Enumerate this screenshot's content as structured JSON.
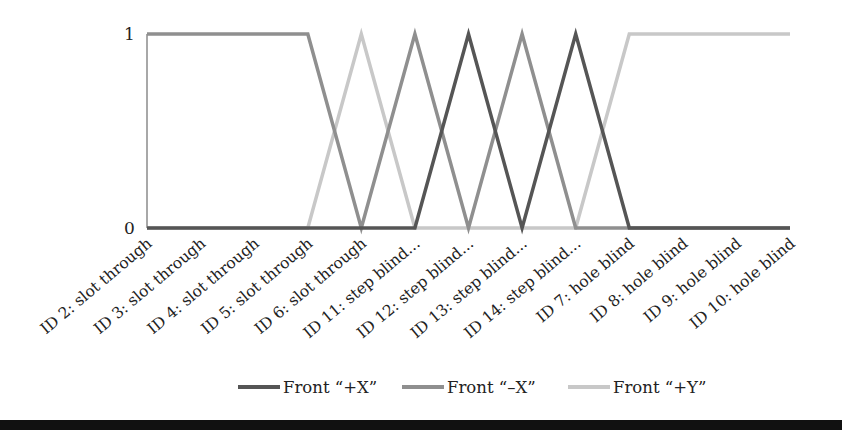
{
  "chart_data": {
    "type": "line",
    "title": "",
    "xlabel": "",
    "ylabel": "",
    "ylim": [
      0,
      1
    ],
    "yticks": [
      "0",
      "1"
    ],
    "grid": false,
    "legend_position": "bottom",
    "categories": [
      "ID 2: slot through",
      "ID 3: slot through",
      "ID 4: slot through",
      "ID 5: slot through",
      "ID 6: slot through",
      "ID 11: step blind...",
      "ID 12: step blind...",
      "ID 13: step blind...",
      "ID 14: step blind...",
      "ID 7: hole blind",
      "ID 8: hole blind",
      "ID 9: hole blind",
      "ID 10: hole blind"
    ],
    "series": [
      {
        "name": "Front “+X”",
        "color": "#555555",
        "values": [
          0,
          0,
          0,
          0,
          0,
          0,
          1,
          0,
          1,
          0,
          0,
          0,
          0
        ]
      },
      {
        "name": "Front “–X”",
        "color": "#8f8f8f",
        "values": [
          1,
          1,
          1,
          1,
          0,
          1,
          0,
          1,
          0,
          0,
          0,
          0,
          0
        ]
      },
      {
        "name": "Front “+Y”",
        "color": "#c8c8c8",
        "values": [
          0,
          0,
          0,
          0,
          1,
          0,
          0,
          0,
          0,
          1,
          1,
          1,
          1
        ]
      }
    ]
  },
  "legend": {
    "items": [
      {
        "label": "Front “+X”",
        "color": "#555555"
      },
      {
        "label": "Front “–X”",
        "color": "#8f8f8f"
      },
      {
        "label": "Front “+Y”",
        "color": "#c8c8c8"
      }
    ]
  },
  "axis": {
    "y_top_label": "1",
    "y_bottom_label": "0",
    "axis_color": "#a0a0a0"
  },
  "colors": {
    "rule": "#111111"
  }
}
